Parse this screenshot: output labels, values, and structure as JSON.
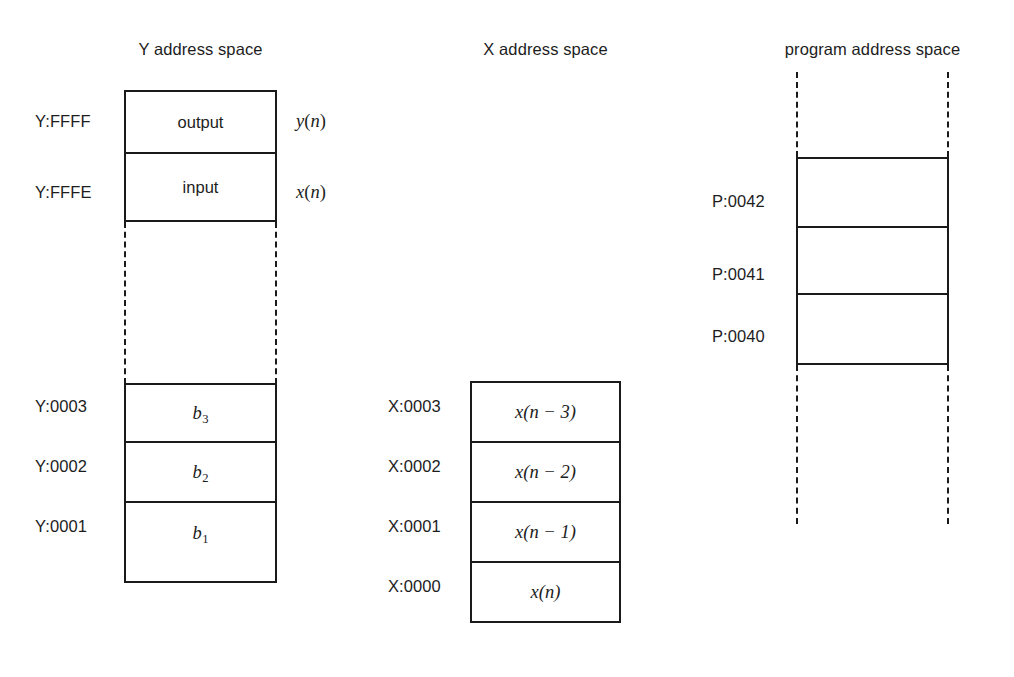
{
  "diagram": {
    "sections": {
      "y_space": {
        "heading": "Y address space",
        "cells": [
          {
            "address": "Y:FFFF",
            "content": "output",
            "note": "y(n)"
          },
          {
            "address": "Y:FFFE",
            "content": "input",
            "note": "x(n)"
          },
          {
            "address": "Y:0003",
            "content": "b3"
          },
          {
            "address": "Y:0002",
            "content": "b2"
          },
          {
            "address": "Y:0001",
            "content": "b1"
          }
        ],
        "coefficient_base": "b",
        "coefficient_subscripts": [
          "3",
          "2",
          "1"
        ],
        "gap": "dashed-continuation"
      },
      "x_space": {
        "heading": "X address space",
        "cells": [
          {
            "address": "X:0003",
            "content": "x(n − 3)"
          },
          {
            "address": "X:0002",
            "content": "x(n − 2)"
          },
          {
            "address": "X:0001",
            "content": "x(n − 1)"
          },
          {
            "address": "X:0000",
            "content": "x(n)"
          }
        ]
      },
      "p_space": {
        "heading": "program address space",
        "cells": [
          {
            "address": "P:0042",
            "content": ""
          },
          {
            "address": "P:0041",
            "content": ""
          },
          {
            "address": "P:0040",
            "content": ""
          }
        ],
        "gap_above": "dashed-continuation",
        "gap_below": "dashed-continuation"
      }
    },
    "colors": {
      "ink": "#1a1a1a",
      "background": "#ffffff"
    }
  }
}
